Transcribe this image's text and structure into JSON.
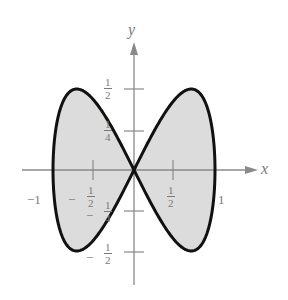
{
  "chart_data": {
    "type": "line",
    "title": "",
    "xlabel": "x",
    "ylabel": "y",
    "xlim": [
      -1,
      1
    ],
    "ylim": [
      -0.5,
      0.5
    ],
    "grid": false,
    "legend": null,
    "x_ticks": [
      {
        "value": -1,
        "label": "−1"
      },
      {
        "value": -0.5,
        "label": "−½",
        "num": "1",
        "den": "2",
        "sign": "−"
      },
      {
        "value": 0.5,
        "label": "½",
        "num": "1",
        "den": "2",
        "sign": ""
      },
      {
        "value": 1,
        "label": "1"
      }
    ],
    "y_ticks": [
      {
        "value": 0.5,
        "num": "1",
        "den": "2",
        "sign": ""
      },
      {
        "value": 0.25,
        "num": "1",
        "den": "4",
        "sign": ""
      },
      {
        "value": -0.25,
        "num": "1",
        "den": "4",
        "sign": "−"
      },
      {
        "value": -0.5,
        "num": "1",
        "den": "2",
        "sign": "−"
      }
    ],
    "series": [
      {
        "name": "curve",
        "parametric": {
          "x": "sin t",
          "y": "sin t cos t",
          "t_range": [
            0,
            6.2832
          ]
        },
        "key_points": [
          {
            "x": 0,
            "y": 0
          },
          {
            "x": 0.707,
            "y": 0.5
          },
          {
            "x": 1,
            "y": 0
          },
          {
            "x": 0.707,
            "y": -0.5
          },
          {
            "x": -0.707,
            "y": 0.5
          },
          {
            "x": -1,
            "y": 0
          },
          {
            "x": -0.707,
            "y": -0.5
          }
        ],
        "stroke": "#111111",
        "fill": "#d9d9d9"
      }
    ],
    "colors": {
      "axis": "#8a8a8a",
      "curve": "#111111",
      "fill": "#dcdcdc",
      "labels": "#7a7a7a"
    }
  },
  "labels": {
    "x_axis": "x",
    "y_axis": "y",
    "x_neg_one": "−1",
    "x_one": "1",
    "x_neg_half_sign": "−",
    "x_neg_half_num": "1",
    "x_neg_half_den": "2",
    "x_half_num": "1",
    "x_half_den": "2",
    "y_half_num": "1",
    "y_half_den": "2",
    "y_quarter_num": "1",
    "y_quarter_den": "4",
    "y_neg_quarter_sign": "−",
    "y_neg_quarter_num": "1",
    "y_neg_quarter_den": "4",
    "y_neg_half_sign": "−",
    "y_neg_half_num": "1",
    "y_neg_half_den": "2"
  }
}
